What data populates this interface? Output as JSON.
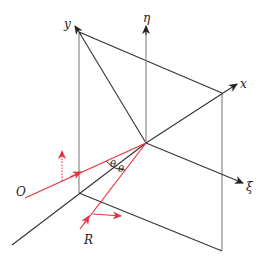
{
  "figure": {
    "labels": {
      "y_axis": "y",
      "eta_axis": "η",
      "x_axis": "x",
      "xi_axis": "ξ",
      "incident_ray": "O",
      "reflected_ray": "R",
      "angle_1": "θ",
      "angle_2": "θ"
    },
    "colors": {
      "frame": "#333333",
      "edge_gray": "#8a8a8a",
      "ray": "#e8323c"
    }
  }
}
